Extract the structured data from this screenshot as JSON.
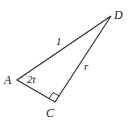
{
  "diagram": {
    "type": "right-triangle",
    "vertices": {
      "A": {
        "label": "A",
        "x": 17,
        "y": 80
      },
      "C": {
        "label": "C",
        "x": 55,
        "y": 102
      },
      "D": {
        "label": "D",
        "x": 111,
        "y": 16
      }
    },
    "sides": {
      "AD": {
        "label": "1"
      },
      "CD": {
        "label": "r"
      }
    },
    "angle_A": {
      "label": "2t"
    },
    "right_angle_at": "C",
    "colors": {
      "stroke": "#333333",
      "text": "#222222",
      "background": "#ffffff"
    }
  }
}
